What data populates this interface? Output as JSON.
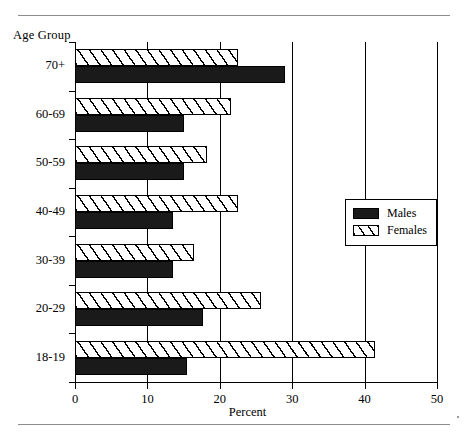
{
  "chart_data": {
    "type": "bar",
    "orientation": "horizontal",
    "title": "",
    "xlabel": "Percent",
    "ylabel": "Age Group",
    "xlim": [
      0,
      50
    ],
    "xticks": [
      0,
      10,
      20,
      30,
      40,
      50
    ],
    "xtick_labels": [
      "0",
      "10",
      "20",
      "30",
      "40",
      "50"
    ],
    "grid": true,
    "legend_position": "right-middle",
    "categories": [
      "18-19",
      "20-29",
      "30-39",
      "40-49",
      "50-59",
      "60-69",
      "70+"
    ],
    "categories_top_to_bottom": [
      "70+",
      "60-69",
      "50-59",
      "40-49",
      "30-39",
      "20-29",
      "18-19"
    ],
    "series": [
      {
        "name": "Males",
        "fill": "solid-black",
        "color": "#1a1a1a",
        "values": [
          15.5,
          17.7,
          13.5,
          13.5,
          15.0,
          15.0,
          29.0
        ]
      },
      {
        "name": "Females",
        "fill": "diagonal-hatch",
        "color": "#ffffff",
        "values": [
          41.5,
          25.7,
          16.5,
          22.5,
          18.3,
          21.5,
          22.5
        ]
      }
    ]
  },
  "legend": {
    "items": [
      {
        "label": "Males"
      },
      {
        "label": "Females"
      }
    ]
  }
}
